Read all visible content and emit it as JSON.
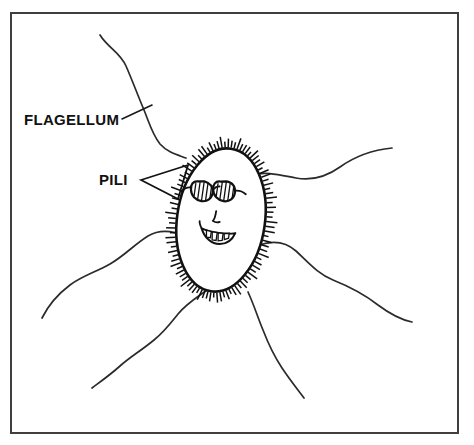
{
  "figure": {
    "background_color": "#ffffff",
    "ink_color": "#111111",
    "frame_color": "#3f3f3f",
    "width": 474,
    "height": 445
  },
  "frame": {
    "x": 11,
    "y": 13,
    "width": 447,
    "height": 420
  },
  "labels": [
    {
      "id": "flagellum",
      "text": "FLAGELLUM",
      "x": 24,
      "y": 125,
      "font_size": 15,
      "pointer_type": "leader-line"
    },
    {
      "id": "pili",
      "text": "PILI",
      "x": 99,
      "y": 185,
      "font_size": 15,
      "pointer_type": "triangle-wedge"
    }
  ],
  "cell": {
    "name": "bacterium-body",
    "shape": "oval",
    "center_x": 221,
    "center_y": 220,
    "radius_x": 44,
    "radius_y": 72,
    "rotation_deg": 8,
    "surface": "pili-fringe",
    "pili_count": 96,
    "pili_length": 9
  },
  "face": {
    "expression": "smiling",
    "features": [
      "sunglasses",
      "nose",
      "open-smile-with-teeth"
    ],
    "sunglasses": {
      "lens_style": "hatched",
      "hatch_lines_per_lens": 5
    },
    "teeth_count": 4
  },
  "flagella": [
    {
      "id": "flagellum-top-left",
      "path": "M 100,35 C 108,48 120,52 126,66 C 133,82 138,96 144,110 C 149,122 152,134 160,144 C 168,153 178,155 186,158"
    },
    {
      "id": "flagellum-right-upper",
      "path": "M 251,175 C 266,171 280,175 296,178 C 312,181 326,177 340,167 C 354,157 372,150 392,148"
    },
    {
      "id": "flagellum-right-lower",
      "path": "M 259,245 C 274,240 286,242 296,251 C 308,262 318,274 333,280 C 348,286 364,294 378,305 C 390,314 402,320 412,322"
    },
    {
      "id": "flagellum-left",
      "path": "M 186,237 C 172,230 160,229 148,236 C 135,244 124,256 110,264 C 96,272 82,276 70,285 C 58,294 48,306 42,318"
    },
    {
      "id": "flagellum-bottom-left",
      "path": "M 207,290 C 196,298 186,304 178,314 C 170,324 164,332 154,340 C 142,350 130,357 120,366 C 110,375 100,382 92,388"
    },
    {
      "id": "flagellum-bottom-right",
      "path": "M 248,292 C 254,305 258,318 263,330 C 268,343 274,356 282,368 C 290,380 298,390 304,398"
    }
  ]
}
